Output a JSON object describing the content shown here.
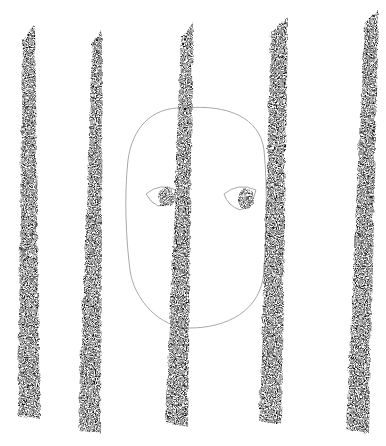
{
  "illustration": {
    "background": "#ffffff",
    "outline_color": "#a8a8a8",
    "crayon_color": "#111111",
    "pupil_color": "#2a2a2a",
    "face": {
      "path": "M 185 108 C 150 106 132 130 128 160 C 124 195 126 240 130 270 C 134 300 160 328 190 328 C 225 328 262 312 264 270 C 266 235 268 190 264 150 C 260 118 228 104 185 108 Z"
    },
    "eyes": [
      {
        "outline": "M 146 194 Q 160 182 176 190 Q 172 206 158 206 Q 150 202 146 194 Z",
        "pupil_cx": 165,
        "pupil_cy": 196,
        "pupil_rx": 8,
        "pupil_ry": 10
      },
      {
        "outline": "M 224 194 Q 238 182 256 190 Q 252 208 240 210 Q 228 206 224 194 Z",
        "pupil_cx": 245,
        "pupil_cy": 198,
        "pupil_rx": 8,
        "pupil_ry": 10
      }
    ],
    "bars": [
      {
        "top_x": 27,
        "top_y": 24,
        "bottom_x": 28,
        "bottom_y": 418,
        "top_w": 12,
        "bottom_w": 22
      },
      {
        "top_x": 96,
        "top_y": 28,
        "bottom_x": 88,
        "bottom_y": 433,
        "top_w": 10,
        "bottom_w": 22
      },
      {
        "top_x": 186,
        "top_y": 22,
        "bottom_x": 175,
        "bottom_y": 425,
        "top_w": 12,
        "bottom_w": 22
      },
      {
        "top_x": 278,
        "top_y": 16,
        "bottom_x": 269,
        "bottom_y": 423,
        "top_w": 16,
        "bottom_w": 22
      },
      {
        "top_x": 370,
        "top_y": 8,
        "bottom_x": 356,
        "bottom_y": 432,
        "top_w": 14,
        "bottom_w": 22
      }
    ]
  }
}
